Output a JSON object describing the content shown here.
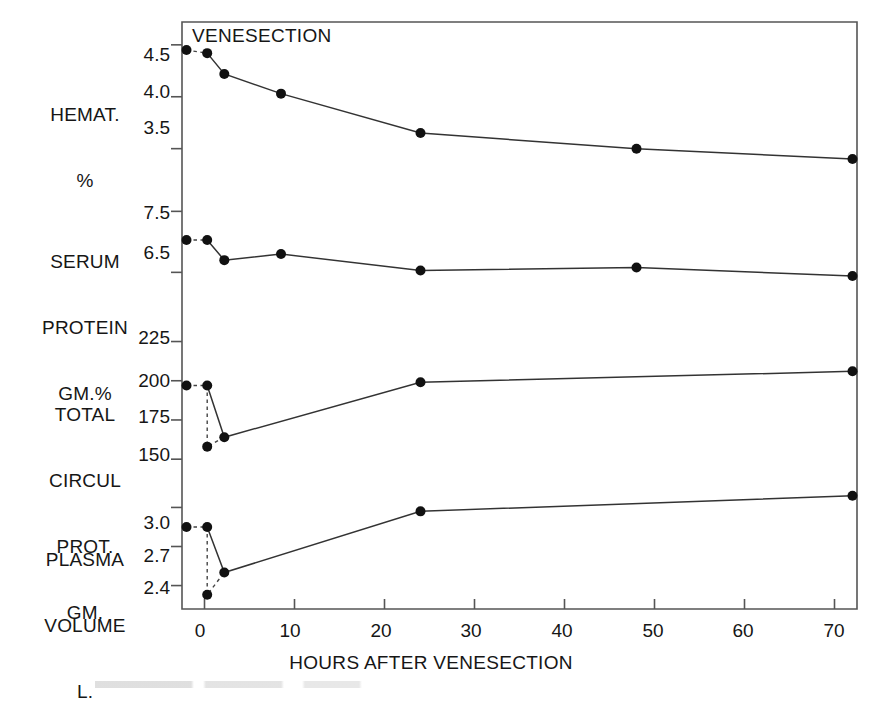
{
  "figure": {
    "note": "VENESECTION",
    "xaxis": {
      "title": "HOURS AFTER VENESECTION",
      "ticks": [
        "0",
        "10",
        "20",
        "30",
        "40",
        "50",
        "60",
        "70"
      ],
      "tickvalues": [
        0,
        10,
        20,
        30,
        40,
        50,
        60,
        70
      ],
      "range": [
        -2.5,
        72.5
      ]
    },
    "panels": [
      {
        "label": "HEMAT.\n%",
        "label_lines": [
          "HEMAT.",
          "%"
        ],
        "yticks": [
          "4.5",
          "4.0",
          "3.5"
        ],
        "ytickvalues": [
          4.5,
          4.0,
          3.5
        ]
      },
      {
        "label": "SERUM\nPROTEIN\nGM.%",
        "label_lines": [
          "SERUM",
          "PROTEIN",
          "GM.%"
        ],
        "yticks": [
          "7.5",
          "6.5"
        ],
        "ytickvalues": [
          7.5,
          6.5
        ]
      },
      {
        "label": "TOTAL\nCIRCUL\nPROT.\nGM.",
        "label_lines": [
          "TOTAL",
          "CIRCUL",
          "PROT.",
          "GM."
        ],
        "yticks": [
          "225",
          "200",
          "175",
          "150"
        ],
        "ytickvalues": [
          225,
          200,
          175,
          150
        ]
      },
      {
        "label": "PLASMA\nVOLUME\nL.",
        "label_lines": [
          "PLASMA",
          "VOLUME",
          "L."
        ],
        "yticks": [
          "3.0",
          "2.7",
          "2.4"
        ],
        "ytickvalues": [
          3.0,
          2.7,
          2.4
        ]
      }
    ]
  },
  "chart_data": {
    "type": "line",
    "title": "",
    "xlabel": "HOURS AFTER VENESECTION",
    "ylabel": "",
    "xlim": [
      -2.5,
      72.5
    ],
    "grid": false,
    "legend": null,
    "annotations": [
      "VENESECTION"
    ],
    "panels": [
      {
        "name": "HEMAT. %",
        "ylabel": "HEMAT. %",
        "ylim": [
          3.15,
          4.72
        ],
        "yticks": [
          4.5,
          4.0,
          3.5
        ],
        "pre_point": {
          "x": -2.0,
          "y": 4.45,
          "label": "pre-venesection"
        },
        "x": [
          0.3,
          2.2,
          8.5,
          24.0,
          48.0,
          72.0
        ],
        "y": [
          4.42,
          4.22,
          4.03,
          3.65,
          3.5,
          3.4
        ],
        "dashed_from_pre_to_first": true
      },
      {
        "name": "SERUM PROTEIN GM.%",
        "ylabel": "SERUM PROTEIN GM.%",
        "ylim": [
          5.85,
          7.85
        ],
        "yticks": [
          7.5,
          6.5
        ],
        "pre_point": {
          "x": -2.0,
          "y": 7.03,
          "label": "pre-venesection"
        },
        "x": [
          0.3,
          2.2,
          8.5,
          24.0,
          48.0,
          72.0
        ],
        "y": [
          7.03,
          6.7,
          6.8,
          6.53,
          6.58,
          6.44
        ],
        "dashed_from_pre_to_first": true
      },
      {
        "name": "TOTAL CIRCUL PROT. GM.",
        "ylabel": "TOTAL CIRCUL PROT. GM.",
        "ylim": [
          138,
          240
        ],
        "yticks": [
          225,
          200,
          175,
          150
        ],
        "pre_point": {
          "x": -2.0,
          "y": 197,
          "label": "pre-venesection"
        },
        "drop_point": {
          "x": 0.3,
          "y": 158,
          "label": "immediately after venesection"
        },
        "x": [
          0.3,
          2.2,
          24.0,
          72.0
        ],
        "y": [
          197,
          164,
          199,
          206
        ],
        "dashed_from_pre_to_first": true
      },
      {
        "name": "PLASMA VOLUME L.",
        "ylabel": "PLASMA VOLUME L.",
        "ylim": [
          2.22,
          3.18
        ],
        "yticks": [
          3.0,
          2.7,
          2.4
        ],
        "pre_point": {
          "x": -2.0,
          "y": 2.85,
          "label": "pre-venesection"
        },
        "drop_point": {
          "x": 0.3,
          "y": 2.33,
          "label": "immediately after venesection"
        },
        "x": [
          0.3,
          2.2,
          24.0,
          72.0
        ],
        "y": [
          2.85,
          2.5,
          2.97,
          3.09
        ],
        "dashed_from_pre_to_first": true
      }
    ]
  }
}
